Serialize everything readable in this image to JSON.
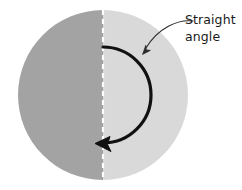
{
  "figure": {
    "canvas": {
      "width": 242,
      "height": 190,
      "background": "#ffffff"
    }
  },
  "circle": {
    "name": "circle-shape",
    "center_x": 103,
    "center_y": 95,
    "radius": 85,
    "left_half_color": "#a3a3a3",
    "right_half_color": "#d9d9d9"
  },
  "diameter_line": {
    "name": "dashed-diameter-line",
    "color": "#ffffff",
    "style": "dashed",
    "x": 103,
    "y_start": 10,
    "y_end": 180,
    "width": 2.2,
    "dash_pattern": "5 4"
  },
  "angle_arc": {
    "name": "angle-arc",
    "color": "#111111",
    "stroke_width": 3.2,
    "radius": 48,
    "start_angle_deg": 90,
    "sweep_deg": 180,
    "direction": "clockwise",
    "measure_deg": 180,
    "arrowhead": "bottom-pointing-left"
  },
  "leader": {
    "name": "leader-line",
    "color": "#2a2a2a",
    "stroke_width": 1.1,
    "from_x": 192,
    "from_y": 21,
    "to_x": 143,
    "to_y": 53,
    "arrowhead": "down-left"
  },
  "label": {
    "name": "straight-angle-label",
    "line1": "Straight",
    "line2": "angle",
    "x": 185,
    "y1": 24,
    "y2": 41,
    "color": "#1a1a1a"
  }
}
